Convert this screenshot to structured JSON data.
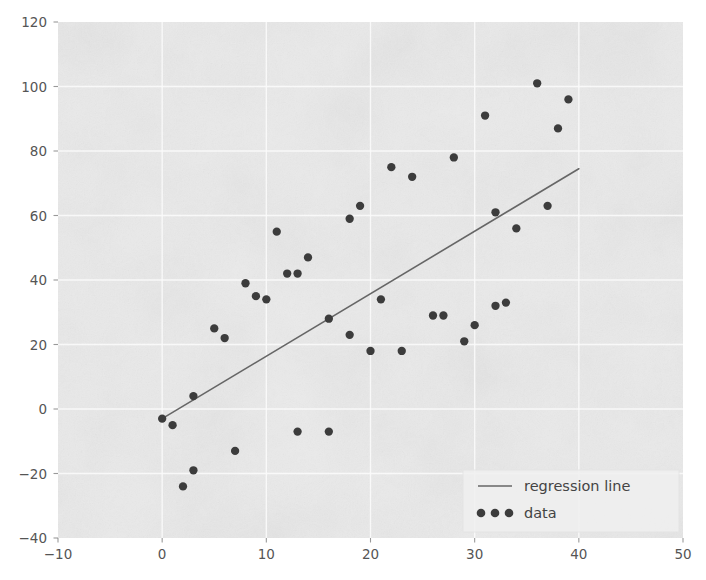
{
  "figure": {
    "background_color": "#ffffff",
    "plot_background_color": "#eaeaea",
    "grid_color": "#fbfbfb",
    "tick_color": "#777777",
    "axis_label_color": "#555555"
  },
  "chart_data": {
    "type": "scatter",
    "title": "",
    "xlabel": "",
    "ylabel": "",
    "xlim": [
      -10,
      50
    ],
    "ylim": [
      -40,
      120
    ],
    "xticks": [
      -10,
      0,
      10,
      20,
      30,
      40,
      50
    ],
    "yticks": [
      -40,
      -20,
      0,
      20,
      40,
      60,
      80,
      100,
      120
    ],
    "grid": true,
    "legend_position": "lower right",
    "series": [
      {
        "name": "regression line",
        "type": "line",
        "color": "#666666",
        "linewidth": 1.6,
        "x": [
          0,
          40
        ],
        "y": [
          -3,
          74.5
        ],
        "slope": 1.94,
        "intercept": -3.0
      },
      {
        "name": "data",
        "type": "scatter",
        "color": "#3c3c3c",
        "marker": "o",
        "markersize": 6.5,
        "points": [
          [
            0,
            -3
          ],
          [
            1,
            -5
          ],
          [
            2,
            -24
          ],
          [
            3,
            -19
          ],
          [
            3,
            4
          ],
          [
            5,
            25
          ],
          [
            6,
            22
          ],
          [
            7,
            -13
          ],
          [
            8,
            39
          ],
          [
            9,
            35
          ],
          [
            10,
            34
          ],
          [
            11,
            55
          ],
          [
            12,
            42
          ],
          [
            13,
            42
          ],
          [
            13,
            -7
          ],
          [
            14,
            47
          ],
          [
            16,
            -7
          ],
          [
            16,
            28
          ],
          [
            18,
            59
          ],
          [
            18,
            23
          ],
          [
            19,
            63
          ],
          [
            20,
            18
          ],
          [
            21,
            34
          ],
          [
            22,
            75
          ],
          [
            23,
            18
          ],
          [
            24,
            72
          ],
          [
            26,
            29
          ],
          [
            27,
            29
          ],
          [
            28,
            78
          ],
          [
            29,
            21
          ],
          [
            30,
            26
          ],
          [
            31,
            91
          ],
          [
            32,
            61
          ],
          [
            32,
            32
          ],
          [
            33,
            33
          ],
          [
            34,
            56
          ],
          [
            36,
            101
          ],
          [
            37,
            63
          ],
          [
            38,
            87
          ],
          [
            39,
            96
          ]
        ]
      }
    ]
  },
  "legend": {
    "entries": [
      {
        "label": "regression line",
        "marker": "line"
      },
      {
        "label": "data",
        "marker": "dots"
      }
    ]
  }
}
